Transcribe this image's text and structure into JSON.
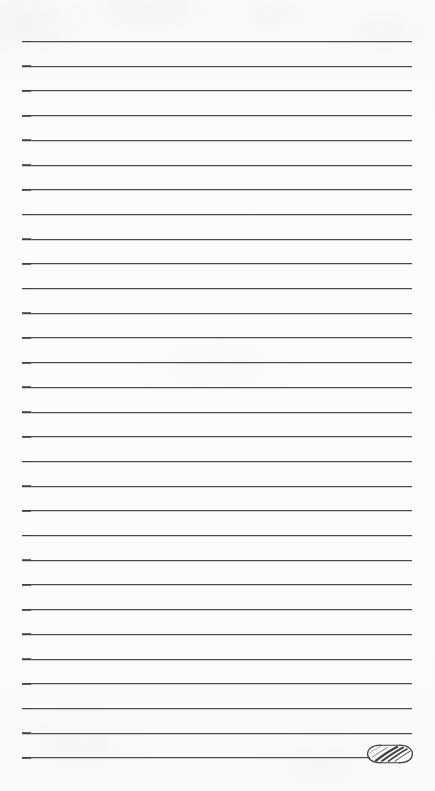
{
  "document": {
    "type": "lined-notepaper",
    "title": "Lined Notepaper",
    "page_width": 435,
    "page_height": 791,
    "background_color": "#fdfdfd",
    "written_text": "",
    "header_text": "",
    "footer_text": ""
  },
  "rules": {
    "label": "Ruled writing lines",
    "count": 30,
    "color": "#4c4c4c",
    "thickness_px": 1,
    "left_x": 22,
    "right_x": 412,
    "first_y": 41,
    "spacing_y": 24.7,
    "last_line_index": 29,
    "last_line_right_x": 370
  },
  "ornament": {
    "name": "calligraphic-swash-flourish",
    "label": "Decorative swash ornament",
    "color": "#3f3f3f",
    "x": 366,
    "y": 741,
    "width": 48,
    "height": 26
  }
}
